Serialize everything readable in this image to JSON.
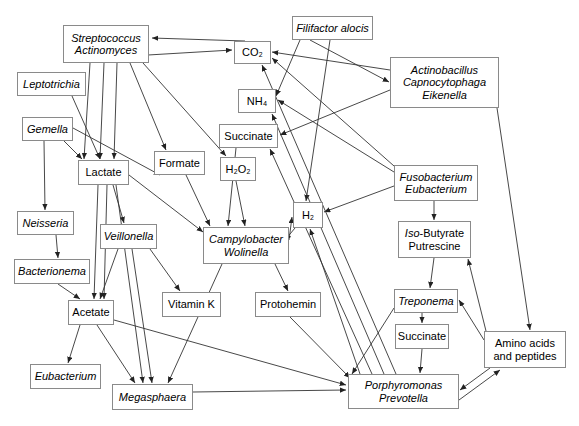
{
  "diagram": {
    "type": "node-link-diagram",
    "width": 579,
    "height": 426,
    "style": {
      "background": "#ffffff",
      "box_border": "#8a8a8a",
      "edge_color": "#333333",
      "text_color": "#000000"
    },
    "nodes": [
      {
        "id": "streptococcus",
        "lines": [
          "Streptococcus",
          "Actinomyces"
        ],
        "italic": true,
        "x": 63,
        "y": 25,
        "w": 86,
        "h": 38,
        "kind": "organism"
      },
      {
        "id": "leptotrichia",
        "lines": [
          "Leptotrichia"
        ],
        "italic": true,
        "x": 17,
        "y": 72,
        "w": 69,
        "h": 24,
        "kind": "organism"
      },
      {
        "id": "gemella",
        "lines": [
          "Gemella"
        ],
        "italic": true,
        "x": 22,
        "y": 117,
        "w": 51,
        "h": 24,
        "kind": "organism"
      },
      {
        "id": "neisseria",
        "lines": [
          "Neisseria"
        ],
        "italic": true,
        "x": 17,
        "y": 211,
        "w": 57,
        "h": 24,
        "kind": "organism"
      },
      {
        "id": "bacterionema",
        "lines": [
          "Bacterionema"
        ],
        "italic": true,
        "x": 14,
        "y": 259,
        "w": 76,
        "h": 25,
        "kind": "organism"
      },
      {
        "id": "eubacterium",
        "lines": [
          "Eubacterium"
        ],
        "italic": true,
        "x": 30,
        "y": 364,
        "w": 71,
        "h": 25,
        "kind": "organism"
      },
      {
        "id": "veillonella",
        "lines": [
          "Veillonella"
        ],
        "italic": true,
        "x": 100,
        "y": 224,
        "w": 57,
        "h": 25,
        "kind": "organism"
      },
      {
        "id": "megasphaera",
        "lines": [
          "Megasphaera"
        ],
        "italic": true,
        "x": 112,
        "y": 384,
        "w": 81,
        "h": 26,
        "kind": "organism"
      },
      {
        "id": "lactate",
        "lines": [
          "Lactate"
        ],
        "italic": false,
        "x": 78,
        "y": 160,
        "w": 51,
        "h": 25,
        "kind": "metabolite"
      },
      {
        "id": "acetate",
        "lines": [
          "Acetate"
        ],
        "italic": false,
        "x": 68,
        "y": 300,
        "w": 46,
        "h": 25,
        "kind": "metabolite"
      },
      {
        "id": "formate",
        "lines": [
          "Formate"
        ],
        "italic": false,
        "x": 154,
        "y": 151,
        "w": 51,
        "h": 24,
        "kind": "metabolite"
      },
      {
        "id": "vitamink",
        "lines": [
          "Vitamin K"
        ],
        "italic": false,
        "x": 162,
        "y": 292,
        "w": 59,
        "h": 25,
        "kind": "metabolite"
      },
      {
        "id": "co2",
        "lines": [
          "CO₂"
        ],
        "italic": false,
        "x": 234,
        "y": 41,
        "w": 37,
        "h": 23,
        "kind": "metabolite"
      },
      {
        "id": "nh4",
        "lines": [
          "NH₄"
        ],
        "italic": false,
        "x": 238,
        "y": 89,
        "w": 38,
        "h": 24,
        "kind": "metabolite"
      },
      {
        "id": "succinate_top",
        "lines": [
          "Succinate"
        ],
        "italic": false,
        "x": 219,
        "y": 124,
        "w": 59,
        "h": 24,
        "kind": "metabolite"
      },
      {
        "id": "h2o2",
        "lines": [
          "H₂O₂"
        ],
        "italic": false,
        "x": 220,
        "y": 157,
        "w": 36,
        "h": 24,
        "kind": "metabolite"
      },
      {
        "id": "campylobacter",
        "lines": [
          "Campylobacter",
          "Wolinella"
        ],
        "italic": true,
        "x": 203,
        "y": 227,
        "w": 86,
        "h": 37,
        "kind": "organism"
      },
      {
        "id": "h2",
        "lines": [
          "H₂"
        ],
        "italic": false,
        "x": 293,
        "y": 202,
        "w": 30,
        "h": 26,
        "kind": "metabolite"
      },
      {
        "id": "protohemin",
        "lines": [
          "Protohemin"
        ],
        "italic": false,
        "x": 255,
        "y": 292,
        "w": 66,
        "h": 25,
        "kind": "metabolite"
      },
      {
        "id": "filifactor",
        "lines": [
          "Filifactor alocis"
        ],
        "italic": true,
        "x": 292,
        "y": 16,
        "w": 81,
        "h": 24,
        "kind": "organism"
      },
      {
        "id": "actinobacillus",
        "lines": [
          "Actinobacillus",
          "Capnocytophaga",
          "Eikenella"
        ],
        "italic": true,
        "x": 390,
        "y": 57,
        "w": 109,
        "h": 51,
        "kind": "organism"
      },
      {
        "id": "fusobacterium",
        "lines": [
          "Fusobacterium",
          "Eubacterium"
        ],
        "italic": true,
        "x": 394,
        "y": 165,
        "w": 84,
        "h": 36,
        "kind": "organism"
      },
      {
        "id": "isobutyrate",
        "lines": [
          "Iso-Butyrate",
          "Putrescine"
        ],
        "italic": false,
        "x": 398,
        "y": 221,
        "w": 73,
        "h": 37,
        "kind": "metabolite",
        "first_line_italic_prefix": "Iso-"
      },
      {
        "id": "treponema",
        "lines": [
          "Treponema"
        ],
        "italic": true,
        "x": 394,
        "y": 289,
        "w": 64,
        "h": 24,
        "kind": "organism"
      },
      {
        "id": "succinate_bottom",
        "lines": [
          "Succinate"
        ],
        "italic": false,
        "x": 395,
        "y": 324,
        "w": 54,
        "h": 25,
        "kind": "metabolite"
      },
      {
        "id": "aminoacids",
        "lines": [
          "Amino acids",
          "and peptides"
        ],
        "italic": false,
        "x": 484,
        "y": 331,
        "w": 82,
        "h": 37,
        "kind": "metabolite"
      },
      {
        "id": "porphyromonas",
        "lines": [
          "Porphyromonas",
          "Prevotella"
        ],
        "italic": true,
        "x": 348,
        "y": 374,
        "w": 111,
        "h": 35,
        "kind": "organism"
      }
    ],
    "edges": [
      {
        "from": "streptococcus",
        "to": "lactate",
        "path": "M 90,63 L 84,159"
      },
      {
        "from": "streptococcus",
        "to": "lactate",
        "path": "M 104,63 L 100,159"
      },
      {
        "from": "streptococcus",
        "to": "lactate",
        "path": "M 117,63 L 114,159"
      },
      {
        "from": "streptococcus",
        "to": "formate",
        "path": "M 130,63 L 166,150"
      },
      {
        "from": "streptococcus",
        "to": "h2o2",
        "path": "M 143,63 L 226,156"
      },
      {
        "from": "streptococcus",
        "to": "co2",
        "path": "M 148,55 L 232,50"
      },
      {
        "from": "co2",
        "to": "streptococcus",
        "path": "M 245,41 L 152,38"
      },
      {
        "from": "leptotrichia",
        "to": "lactate",
        "path": "M 72,96 L 100,159"
      },
      {
        "from": "gemella",
        "to": "lactate",
        "path": "M 64,141 L 82,159"
      },
      {
        "from": "gemella",
        "to": "formate",
        "path": "M 73,128 L 160,175"
      },
      {
        "from": "gemella",
        "to": "neisseria",
        "path": "M 44,141 L 45,210"
      },
      {
        "from": "lactate",
        "to": "veillonella",
        "path": "M 113,185 L 124,223"
      },
      {
        "from": "lactate",
        "to": "acetate",
        "path": "M 98,185 L 94,299"
      },
      {
        "from": "lactate",
        "to": "acetate",
        "path": "M 107,185 L 104,299"
      },
      {
        "from": "lactate",
        "to": "megasphaera",
        "path": "M 116,185 L 143,383"
      },
      {
        "from": "veillonella",
        "to": "acetate",
        "path": "M 118,249 L 100,299"
      },
      {
        "from": "veillonella",
        "to": "megasphaera",
        "path": "M 132,249 L 152,383"
      },
      {
        "from": "veillonella",
        "to": "vitamink",
        "path": "M 150,249 L 180,291"
      },
      {
        "from": "neisseria",
        "to": "bacterionema",
        "path": "M 56,235 L 58,258"
      },
      {
        "from": "bacterionema",
        "to": "acetate",
        "path": "M 58,284 L 80,299"
      },
      {
        "from": "acetate",
        "to": "eubacterium",
        "path": "M 80,325 L 68,363"
      },
      {
        "from": "acetate",
        "to": "megasphaera",
        "path": "M 97,325 L 135,383"
      },
      {
        "from": "acetate",
        "to": "porphyromonas",
        "path": "M 114,320 L 346,385"
      },
      {
        "from": "campylobacter",
        "to": "h2",
        "path": "M 289,240 L 292,217"
      },
      {
        "from": "h2",
        "to": "campylobacter",
        "path": "M 295,228 L 285,240"
      },
      {
        "from": "campylobacter",
        "to": "protohemin",
        "path": "M 275,264 L 288,291"
      },
      {
        "from": "campylobacter",
        "to": "megasphaera",
        "path": "M 222,264 L 168,383"
      },
      {
        "from": "succinate_top",
        "to": "campylobacter",
        "path": "M 236,148 L 228,226"
      },
      {
        "from": "h2o2",
        "to": "campylobacter",
        "path": "M 236,181 L 245,226"
      },
      {
        "from": "formate",
        "to": "campylobacter",
        "path": "M 186,175 L 210,226"
      },
      {
        "from": "lactate",
        "to": "campylobacter",
        "path": "M 129,175 L 203,232"
      },
      {
        "from": "filifactor",
        "to": "nh4",
        "path": "M 300,40 L 276,96"
      },
      {
        "from": "filifactor",
        "to": "h2",
        "path": "M 330,40 L 306,201"
      },
      {
        "from": "filifactor",
        "to": "actinobacillus",
        "path": "M 310,40 L 389,82"
      },
      {
        "from": "actinobacillus",
        "to": "succinate_top",
        "path": "M 390,90 L 280,135"
      },
      {
        "from": "actinobacillus",
        "to": "co2",
        "path": "M 390,70 L 272,52"
      },
      {
        "from": "actinobacillus",
        "to": "aminoacids",
        "path": "M 497,108 L 530,330"
      },
      {
        "from": "fusobacterium",
        "to": "nh4",
        "path": "M 394,172 L 278,100"
      },
      {
        "from": "fusobacterium",
        "to": "co2",
        "path": "M 394,166 L 272,58"
      },
      {
        "from": "fusobacterium",
        "to": "h2",
        "path": "M 394,186 L 324,212"
      },
      {
        "from": "fusobacterium",
        "to": "isobutyrate",
        "path": "M 434,201 L 434,220"
      },
      {
        "from": "isobutyrate",
        "to": "treponema",
        "path": "M 434,258 L 430,288"
      },
      {
        "from": "treponema",
        "to": "succinate_bottom",
        "path": "M 422,313 L 422,323"
      },
      {
        "from": "succinate_bottom",
        "to": "porphyromonas",
        "path": "M 422,349 L 420,373"
      },
      {
        "from": "aminoacids",
        "to": "isobutyrate",
        "path": "M 486,331 L 468,259"
      },
      {
        "from": "aminoacids",
        "to": "treponema",
        "path": "M 484,340 L 459,300"
      },
      {
        "from": "aminoacids",
        "to": "porphyromonas",
        "path": "M 490,368 L 460,390"
      },
      {
        "from": "porphyromonas",
        "to": "aminoacids",
        "path": "M 459,400 L 500,370"
      },
      {
        "from": "porphyromonas",
        "to": "h2",
        "path": "M 360,374 L 310,229"
      },
      {
        "from": "porphyromonas",
        "to": "succinate_top",
        "path": "M 372,374 L 270,149"
      },
      {
        "from": "porphyromonas",
        "to": "nh4",
        "path": "M 384,374 L 272,114"
      },
      {
        "from": "porphyromonas",
        "to": "co2",
        "path": "M 396,374 L 262,65"
      },
      {
        "from": "megasphaera",
        "to": "porphyromonas",
        "path": "M 193,392 L 346,390"
      },
      {
        "from": "protohemin",
        "to": "porphyromonas",
        "path": "M 290,317 L 350,378"
      },
      {
        "from": "treponema",
        "to": "porphyromonas",
        "path": "M 394,308 L 352,374"
      }
    ]
  }
}
